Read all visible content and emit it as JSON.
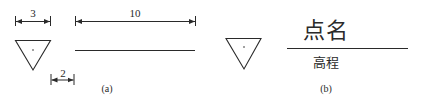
{
  "figure_a": {
    "caption": "(a)",
    "dimensions": {
      "triangle_width": "3",
      "line_length": "10",
      "gap": "2"
    }
  },
  "figure_b": {
    "caption": "(b)",
    "point_name": "点名",
    "elevation": "高程"
  },
  "colors": {
    "stroke": "#2a2a2a",
    "background": "#ffffff"
  }
}
